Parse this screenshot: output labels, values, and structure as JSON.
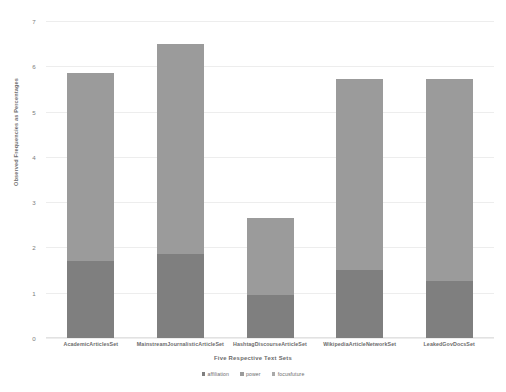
{
  "chart_data": {
    "type": "bar",
    "subtype": "stacked-bar",
    "title": "",
    "xlabel": "Five Respective Text Sets",
    "ylabel": "Observed Frequencies as Percentages",
    "ylim": [
      0,
      7
    ],
    "ytick_labels": [
      "0",
      "1",
      "2",
      "3",
      "4",
      "5",
      "6",
      "7"
    ],
    "ytick_values": [
      0,
      1,
      2,
      3,
      4,
      5,
      6,
      7
    ],
    "grid": true,
    "legend_position": "bottom",
    "categories": [
      "AcademicArticlesSet",
      "MainstreamJournalisticArticleSet",
      "HashtagDiscourseArticleSet",
      "WikipediaArticleNetworkSet",
      "LeakedGovDocsSet"
    ],
    "series": [
      {
        "name": "affiliation",
        "color": "#7f7f7f",
        "values": [
          1.7,
          1.85,
          0.95,
          1.5,
          1.25
        ]
      },
      {
        "name": "power",
        "color": "#9b9b9b",
        "values": [
          4.15,
          4.65,
          1.7,
          4.22,
          4.47
        ]
      },
      {
        "name": "focusfuture",
        "color": "#a9a9a9",
        "values": [
          0,
          0,
          0,
          0,
          0
        ]
      }
    ],
    "totals": [
      5.85,
      6.5,
      2.65,
      5.72,
      5.72
    ]
  },
  "legend": {
    "items": [
      {
        "label": "affiliation",
        "color": "#7f7f7f"
      },
      {
        "label": "power",
        "color": "#9b9b9b"
      },
      {
        "label": "focusfuture",
        "color": "#a9a9a9"
      }
    ]
  },
  "colors": {
    "grid": "#ededed",
    "axis": "#e2e2e2",
    "text": "#6d6d6d",
    "background": "#ffffff"
  }
}
